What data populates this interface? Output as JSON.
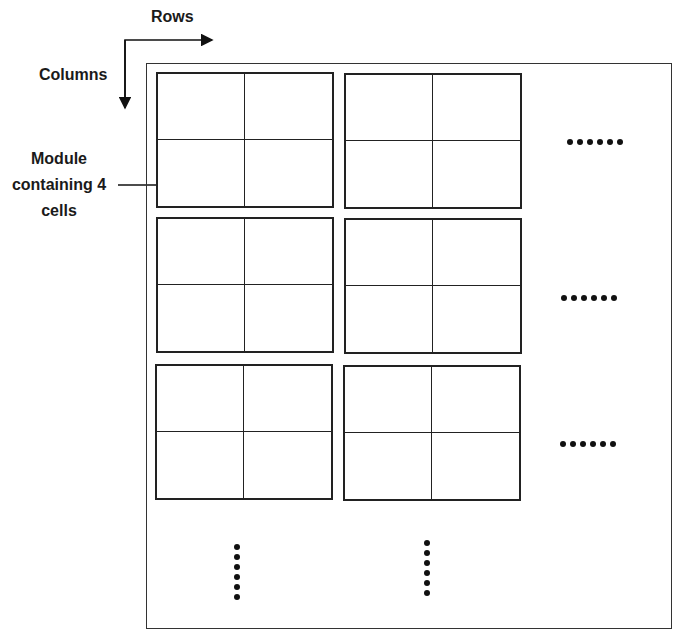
{
  "labels": {
    "rows": "Rows",
    "columns": "Columns",
    "module_line1": "Module",
    "module_line2": "containing 4",
    "module_line3": "cells"
  },
  "grid": {
    "module_rows": 3,
    "module_cols": 2,
    "cells_per_module": 4,
    "continuation_marks": {
      "horizontal": 3,
      "vertical": 2,
      "dots_each": 6
    }
  },
  "colors": {
    "line": "#222222",
    "background": "#ffffff"
  }
}
